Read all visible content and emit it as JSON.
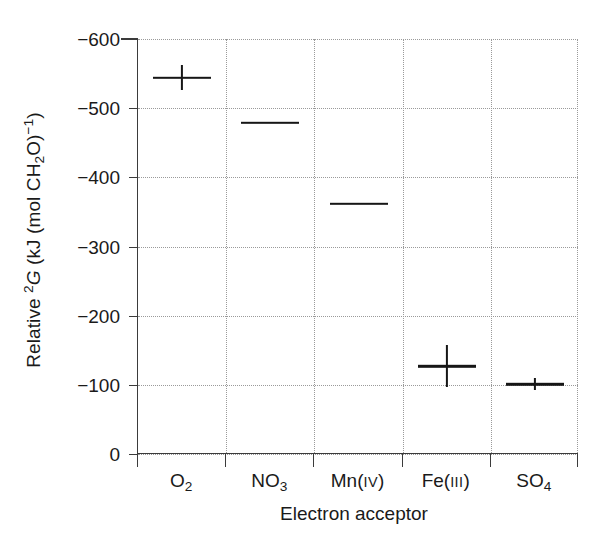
{
  "chart_data": {
    "type": "scatter",
    "title": "",
    "xlabel": "Electron acceptor",
    "ylabel_plain": "Relative ΔG (kJ (mol CH2O)−1)",
    "ylabel_parts": {
      "prefix": "Relative ",
      "symbol_sup": "2",
      "symbol": "G",
      "unit_open": " (kJ (mol CH",
      "unit_sub": "2",
      "unit_mid": "O)",
      "unit_sup": "−1",
      "unit_close": ")"
    },
    "categories": [
      "O2",
      "NO3",
      "Mn(IV)",
      "Fe(III)",
      "SO4"
    ],
    "category_labels": [
      {
        "base": "O",
        "sub": "2",
        "roman": ""
      },
      {
        "base": "NO",
        "sub": "3",
        "roman": ""
      },
      {
        "base": "Mn(",
        "sub": "",
        "roman": "IV",
        "close": ")"
      },
      {
        "base": "Fe(",
        "sub": "",
        "roman": "III",
        "close": ")"
      },
      {
        "base": "SO",
        "sub": "4",
        "roman": ""
      }
    ],
    "values": [
      -544,
      -479,
      -362,
      -127,
      -101
    ],
    "errors": [
      18,
      0,
      0,
      30,
      9
    ],
    "ylim": [
      -600,
      0
    ],
    "yticks": [
      -600,
      -500,
      -400,
      -300,
      -200,
      -100,
      0
    ],
    "ytick_labels": [
      "−600",
      "−500",
      "−400",
      "−300",
      "−200",
      "−100",
      "0"
    ],
    "y_axis_inverted": true,
    "grid": "dotted both axes",
    "legend": "none",
    "marker_style": "horizontal bar with vertical error bar",
    "colors": {
      "marker": "#161616",
      "axis": "#3b3b3b",
      "grid": "#9a9a9a",
      "background": "#ffffff"
    }
  }
}
